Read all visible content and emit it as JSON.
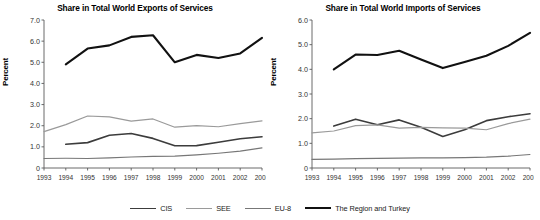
{
  "figure": {
    "ylabel": "Percent"
  },
  "legend": {
    "position": "bottom-center",
    "items": [
      {
        "label": "CIS",
        "color": "#3c3c3c",
        "width": 1.6
      },
      {
        "label": "SEE",
        "color": "#9a9a9a",
        "width": 1.2
      },
      {
        "label": "EU-8",
        "color": "#777777",
        "width": 1.1
      },
      {
        "label": "The Region and Turkey",
        "color": "#111111",
        "width": 2.1
      }
    ]
  },
  "chart_data": [
    {
      "type": "line",
      "title": "Share in Total World Exports of Services",
      "xlabel": "",
      "ylabel": "Percent",
      "categories": [
        1993,
        1994,
        1995,
        1996,
        1997,
        1998,
        1999,
        2000,
        2001,
        2002,
        2003
      ],
      "xlim": [
        1993,
        2003
      ],
      "ylim": [
        0,
        7.0
      ],
      "yticks": [
        "0",
        "1.0",
        "2.0",
        "3.0",
        "4.0",
        "5.0",
        "6.0",
        "7.0"
      ],
      "ytick_values": [
        0,
        1.0,
        2.0,
        3.0,
        4.0,
        5.0,
        6.0,
        7.0
      ],
      "xticks": [
        "1993",
        "1994",
        "1995",
        "1996",
        "1997",
        "1998",
        "1999",
        "2000",
        "2001",
        "2002",
        "2003"
      ],
      "grid": false,
      "legend": "bottom",
      "series": [
        {
          "name": "The Region and Turkey",
          "color": "#111111",
          "width": 2.1,
          "x": [
            1994,
            1995,
            1996,
            1997,
            1998,
            1999,
            2000,
            2001,
            2002,
            2003
          ],
          "values": [
            4.9,
            5.65,
            5.8,
            6.2,
            6.28,
            5.0,
            5.35,
            5.2,
            5.42,
            6.15
          ]
        },
        {
          "name": "SEE",
          "color": "#9a9a9a",
          "width": 1.2,
          "x": [
            1993,
            1994,
            1995,
            1996,
            1997,
            1998,
            1999,
            2000,
            2001,
            2002,
            2003
          ],
          "values": [
            1.72,
            2.05,
            2.46,
            2.42,
            2.22,
            2.32,
            1.93,
            2.0,
            1.95,
            2.1,
            2.23
          ]
        },
        {
          "name": "CIS",
          "color": "#3c3c3c",
          "width": 1.6,
          "x": [
            1994,
            1995,
            1996,
            1997,
            1998,
            1999,
            2000,
            2001,
            2002,
            2003
          ],
          "values": [
            1.12,
            1.2,
            1.55,
            1.63,
            1.4,
            1.05,
            1.06,
            1.22,
            1.38,
            1.48
          ]
        },
        {
          "name": "EU-8",
          "color": "#777777",
          "width": 1.1,
          "x": [
            1993,
            1994,
            1995,
            1996,
            1997,
            1998,
            1999,
            2000,
            2001,
            2002,
            2003
          ],
          "values": [
            0.45,
            0.46,
            0.45,
            0.48,
            0.52,
            0.55,
            0.56,
            0.62,
            0.7,
            0.8,
            0.95
          ]
        }
      ]
    },
    {
      "type": "line",
      "title": "Share in Total World Imports of Services",
      "xlabel": "",
      "ylabel": "Percent",
      "categories": [
        1993,
        1994,
        1995,
        1996,
        1997,
        1998,
        1999,
        2000,
        2001,
        2002,
        2003
      ],
      "xlim": [
        1993,
        2003
      ],
      "ylim": [
        0,
        6.0
      ],
      "yticks": [
        "0",
        "1.0",
        "2.0",
        "3.0",
        "4.0",
        "5.0",
        "6.0"
      ],
      "ytick_values": [
        0,
        1.0,
        2.0,
        3.0,
        4.0,
        5.0,
        6.0
      ],
      "xticks": [
        "1993",
        "1994",
        "1995",
        "1996",
        "1997",
        "1998",
        "1999",
        "2000",
        "2001",
        "2002",
        "2003"
      ],
      "grid": false,
      "legend": "bottom",
      "series": [
        {
          "name": "The Region and Turkey",
          "color": "#111111",
          "width": 2.1,
          "x": [
            1994,
            1995,
            1996,
            1997,
            1998,
            1999,
            2000,
            2001,
            2002,
            2003
          ],
          "values": [
            4.0,
            4.6,
            4.58,
            4.75,
            4.4,
            4.05,
            4.3,
            4.55,
            4.95,
            5.48
          ]
        },
        {
          "name": "CIS",
          "color": "#3c3c3c",
          "width": 1.6,
          "x": [
            1994,
            1995,
            1996,
            1997,
            1998,
            1999,
            2000,
            2001,
            2002,
            2003
          ],
          "values": [
            1.7,
            1.98,
            1.75,
            1.95,
            1.65,
            1.28,
            1.55,
            1.92,
            2.08,
            2.2
          ]
        },
        {
          "name": "SEE",
          "color": "#9a9a9a",
          "width": 1.2,
          "x": [
            1993,
            1994,
            1995,
            1996,
            1997,
            1998,
            1999,
            2000,
            2001,
            2002,
            2003
          ],
          "values": [
            1.42,
            1.5,
            1.72,
            1.75,
            1.62,
            1.65,
            1.63,
            1.62,
            1.55,
            1.8,
            1.98
          ]
        },
        {
          "name": "EU-8",
          "color": "#777777",
          "width": 1.1,
          "x": [
            1993,
            1994,
            1995,
            1996,
            1997,
            1998,
            1999,
            2000,
            2001,
            2002,
            2003
          ],
          "values": [
            0.35,
            0.36,
            0.38,
            0.39,
            0.4,
            0.41,
            0.41,
            0.42,
            0.44,
            0.48,
            0.55
          ]
        }
      ]
    }
  ]
}
